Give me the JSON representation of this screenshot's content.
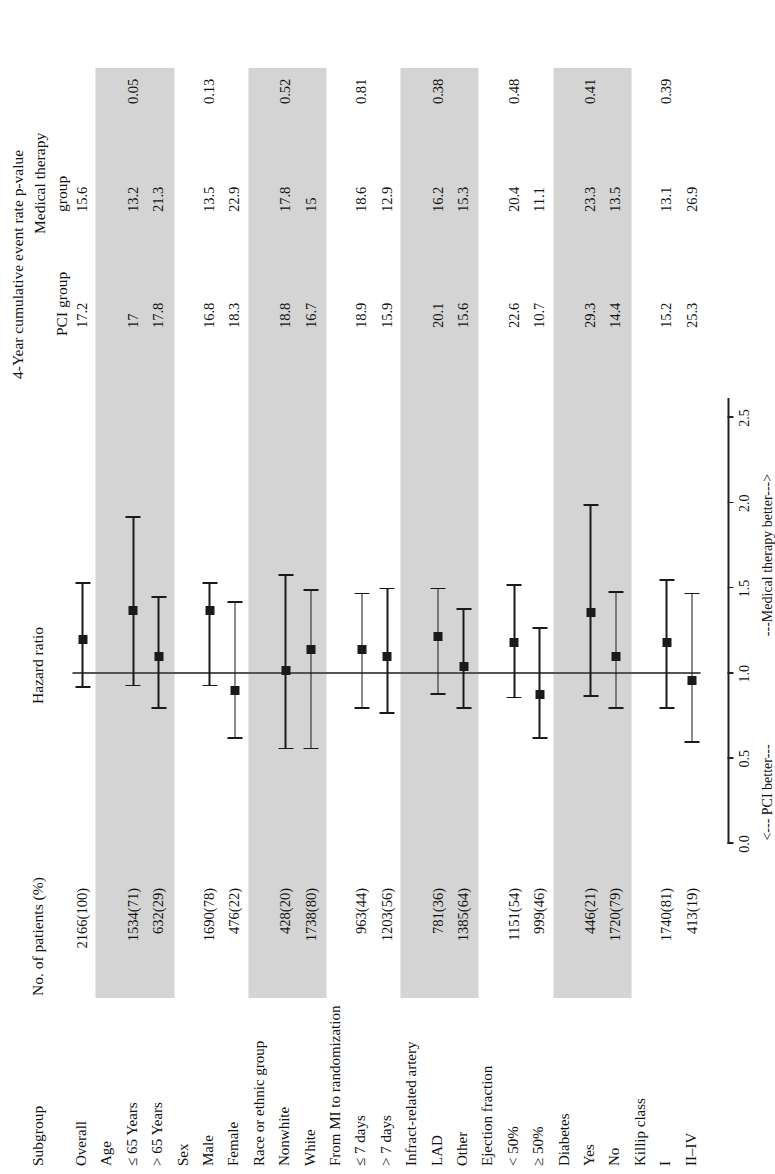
{
  "figure": {
    "column_headers": {
      "subgroup": "Subgroup",
      "no_patients": "No. of patients (%)",
      "hazard_ratio": "Hazard ratio",
      "event_rate_title": "4-Year cumulative event rate p-value",
      "pci_group": "PCI group",
      "medical_therapy": "Medical therapy",
      "medical_therapy_group": "group"
    },
    "axis": {
      "ticks": [
        "0.0",
        "0.5",
        "1.0",
        "1.5",
        "2.0",
        "2.5"
      ],
      "tick_values": [
        0.0,
        0.5,
        1.0,
        1.5,
        2.0,
        2.5
      ],
      "left_note": "<--- PCI better---",
      "right_note": "---Medical therapy better--->",
      "reference": 1.0
    },
    "rows": [
      {
        "kind": "data",
        "label": "Overall",
        "n": "2166(100)",
        "hr": 1.2,
        "lo": 0.92,
        "hi": 1.53,
        "pci": "17.2",
        "med": "15.6",
        "p": "",
        "shaded": false
      },
      {
        "kind": "head",
        "label": "Age",
        "n": "",
        "hr": null,
        "lo": null,
        "hi": null,
        "pci": "",
        "med": "",
        "p": "",
        "shaded": true
      },
      {
        "kind": "data",
        "label": "≤ 65 Years",
        "n": "1534(71)",
        "hr": 1.37,
        "lo": 0.93,
        "hi": 1.92,
        "pci": "17",
        "med": "13.2",
        "p": "0.05",
        "shaded": true
      },
      {
        "kind": "data",
        "label": "> 65 Years",
        "n": "632(29)",
        "hr": 1.1,
        "lo": 0.8,
        "hi": 1.45,
        "pci": "17.8",
        "med": "21.3",
        "p": "",
        "shaded": true
      },
      {
        "kind": "head",
        "label": "Sex",
        "n": "",
        "hr": null,
        "lo": null,
        "hi": null,
        "pci": "",
        "med": "",
        "p": "",
        "shaded": false
      },
      {
        "kind": "data",
        "label": "Male",
        "n": "1690(78)",
        "hr": 1.37,
        "lo": 0.93,
        "hi": 1.53,
        "pci": "16.8",
        "med": "13.5",
        "p": "0.13",
        "shaded": false
      },
      {
        "kind": "data",
        "label": "Female",
        "n": "476(22)",
        "hr": 0.9,
        "lo": 0.62,
        "hi": 1.42,
        "pci": "18.3",
        "med": "22.9",
        "p": "",
        "shaded": false
      },
      {
        "kind": "head",
        "label": "Race or ethnic group",
        "n": "",
        "hr": null,
        "lo": null,
        "hi": null,
        "pci": "",
        "med": "",
        "p": "",
        "shaded": true
      },
      {
        "kind": "data",
        "label": "Nonwhite",
        "n": "428(20)",
        "hr": 1.02,
        "lo": 0.56,
        "hi": 1.58,
        "pci": "18.8",
        "med": "17.8",
        "p": "0.52",
        "shaded": true
      },
      {
        "kind": "data",
        "label": "White",
        "n": "1738(80)",
        "hr": 1.14,
        "lo": 0.56,
        "hi": 1.49,
        "pci": "16.7",
        "med": "15",
        "p": "",
        "shaded": true
      },
      {
        "kind": "head",
        "label": "From MI to randomization",
        "n": "",
        "hr": null,
        "lo": null,
        "hi": null,
        "pci": "",
        "med": "",
        "p": "",
        "shaded": false
      },
      {
        "kind": "data",
        "label": "≤ 7 days",
        "n": "963(44)",
        "hr": 1.14,
        "lo": 0.8,
        "hi": 1.47,
        "pci": "18.9",
        "med": "18.6",
        "p": "0.81",
        "shaded": false
      },
      {
        "kind": "data",
        "label": "> 7 days",
        "n": "1203(56)",
        "hr": 1.1,
        "lo": 0.77,
        "hi": 1.5,
        "pci": "15.9",
        "med": "12.9",
        "p": "",
        "shaded": false
      },
      {
        "kind": "head",
        "label": "Infract-related artery",
        "n": "",
        "hr": null,
        "lo": null,
        "hi": null,
        "pci": "",
        "med": "",
        "p": "",
        "shaded": true
      },
      {
        "kind": "data",
        "label": "LAD",
        "n": "781(36)",
        "hr": 1.22,
        "lo": 0.88,
        "hi": 1.5,
        "pci": "20.1",
        "med": "16.2",
        "p": "0.38",
        "shaded": true
      },
      {
        "kind": "data",
        "label": "Other",
        "n": "1385(64)",
        "hr": 1.04,
        "lo": 0.8,
        "hi": 1.38,
        "pci": "15.6",
        "med": "15.3",
        "p": "",
        "shaded": true
      },
      {
        "kind": "head",
        "label": "Ejection fraction",
        "n": "",
        "hr": null,
        "lo": null,
        "hi": null,
        "pci": "",
        "med": "",
        "p": "",
        "shaded": false
      },
      {
        "kind": "data",
        "label": "< 50%",
        "n": "1151(54)",
        "hr": 1.18,
        "lo": 0.86,
        "hi": 1.52,
        "pci": "22.6",
        "med": "20.4",
        "p": "0.48",
        "shaded": false
      },
      {
        "kind": "data",
        "label": "≥ 50%",
        "n": "999(46)",
        "hr": 0.88,
        "lo": 0.62,
        "hi": 1.27,
        "pci": "10.7",
        "med": "11.1",
        "p": "",
        "shaded": false
      },
      {
        "kind": "head",
        "label": "Diabetes",
        "n": "",
        "hr": null,
        "lo": null,
        "hi": null,
        "pci": "",
        "med": "",
        "p": "",
        "shaded": true
      },
      {
        "kind": "data",
        "label": "Yes",
        "n": "446(21)",
        "hr": 1.36,
        "lo": 0.87,
        "hi": 1.99,
        "pci": "29.3",
        "med": "23.3",
        "p": "0.41",
        "shaded": true
      },
      {
        "kind": "data",
        "label": "No",
        "n": "1720(79)",
        "hr": 1.1,
        "lo": 0.8,
        "hi": 1.48,
        "pci": "14.4",
        "med": "13.5",
        "p": "",
        "shaded": true
      },
      {
        "kind": "head",
        "label": "Killip class",
        "n": "",
        "hr": null,
        "lo": null,
        "hi": null,
        "pci": "",
        "med": "",
        "p": "",
        "shaded": false
      },
      {
        "kind": "data",
        "label": "I",
        "n": "1740(81)",
        "hr": 1.18,
        "lo": 0.8,
        "hi": 1.55,
        "pci": "15.2",
        "med": "13.1",
        "p": "0.39",
        "shaded": false
      },
      {
        "kind": "data",
        "label": "II–IV",
        "n": "413(19)",
        "hr": 0.96,
        "lo": 0.6,
        "hi": 1.47,
        "pci": "25.3",
        "med": "26.9",
        "p": "",
        "shaded": false
      }
    ]
  },
  "chart_data": {
    "type": "scatter",
    "xlabel": "Hazard ratio",
    "ylabel": "Subgroup",
    "xlim": [
      0.0,
      2.7
    ],
    "xticks": [
      0.0,
      0.5,
      1.0,
      1.5,
      2.0,
      2.5
    ],
    "grid": false,
    "reference_line": 1.0,
    "categories": [
      "Overall",
      "≤ 65 Years",
      "> 65 Years",
      "Male",
      "Female",
      "Nonwhite",
      "White",
      "≤ 7 days",
      "> 7 days",
      "LAD",
      "Other",
      "< 50%",
      "≥ 50%",
      "Yes",
      "No",
      "I",
      "II–IV"
    ],
    "values": [
      1.2,
      1.37,
      1.1,
      1.37,
      0.9,
      1.02,
      1.14,
      1.14,
      1.1,
      1.22,
      1.04,
      1.18,
      0.88,
      1.36,
      1.1,
      1.18,
      0.96
    ],
    "ci_low": [
      0.92,
      0.93,
      0.8,
      0.93,
      0.62,
      0.56,
      0.56,
      0.8,
      0.77,
      0.88,
      0.8,
      0.86,
      0.62,
      0.87,
      0.8,
      0.8,
      0.6
    ],
    "ci_high": [
      1.53,
      1.92,
      1.45,
      1.53,
      1.42,
      1.58,
      1.49,
      1.47,
      1.5,
      1.5,
      1.38,
      1.52,
      1.27,
      1.99,
      1.48,
      1.55,
      1.47
    ],
    "annotations": [
      "<--- PCI better---",
      "---Medical therapy better--->"
    ]
  }
}
